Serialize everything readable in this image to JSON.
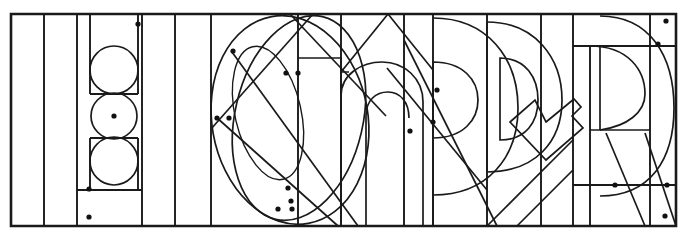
{
  "artwork": {
    "title": "Geometric lettering construction drawing",
    "medium": "line drawing",
    "stroke_color": "#1a1a1a",
    "background_color": "#ffffff",
    "width": 688,
    "height": 241,
    "letterforms_depicted": "H I O n P D R",
    "description": "Overlapping constructed letterforms inside a rectangular frame with vertical guide columns, stacked circles, ellipses, diagonals and construction dots"
  },
  "frame": {
    "name": "outer-rectangle",
    "x": 11,
    "y": 14,
    "width": 665,
    "height": 212
  },
  "guide_columns": {
    "label": "vertical-guide-lines",
    "x_positions": [
      44,
      77,
      110,
      142,
      175,
      211,
      252,
      298,
      341,
      388,
      433,
      487,
      541,
      573,
      614,
      650
    ]
  },
  "guide_rows": {
    "label": "horizontal-guide-lines",
    "y_positions": [
      31,
      57,
      90,
      124,
      158,
      190
    ]
  },
  "circles": {
    "label": "stacked-construction-circles",
    "items": [
      {
        "name": "circle-top",
        "cx": 114,
        "cy": 70,
        "r": 24
      },
      {
        "name": "circle-middle",
        "cx": 114,
        "cy": 116,
        "r": 23
      },
      {
        "name": "circle-bottom",
        "cx": 114,
        "cy": 161,
        "r": 24
      }
    ]
  },
  "ellipses": {
    "label": "letter-o-construction-ellipses",
    "items": [
      {
        "name": "ellipse-o-outer",
        "cx": 288,
        "cy": 120,
        "rx": 78,
        "ry": 105,
        "rotation": -12
      },
      {
        "name": "ellipse-o-inner",
        "cx": 272,
        "cy": 112,
        "rx": 34,
        "ry": 68,
        "rotation": -14
      },
      {
        "name": "ellipse-o-tilt",
        "cx": 296,
        "cy": 118,
        "rx": 62,
        "ry": 100,
        "rotation": 14
      }
    ]
  },
  "construction_dots": {
    "label": "construction-reference-points",
    "radius": 2.6,
    "points": [
      {
        "x": 138,
        "y": 24
      },
      {
        "x": 114,
        "y": 116
      },
      {
        "x": 89,
        "y": 189
      },
      {
        "x": 89,
        "y": 217
      },
      {
        "x": 233,
        "y": 51
      },
      {
        "x": 217,
        "y": 118
      },
      {
        "x": 229,
        "y": 118
      },
      {
        "x": 286,
        "y": 73
      },
      {
        "x": 298,
        "y": 73
      },
      {
        "x": 288,
        "y": 188
      },
      {
        "x": 291,
        "y": 201
      },
      {
        "x": 278,
        "y": 209
      },
      {
        "x": 292,
        "y": 209
      },
      {
        "x": 410,
        "y": 131
      },
      {
        "x": 433,
        "y": 122
      },
      {
        "x": 437,
        "y": 90
      },
      {
        "x": 615,
        "y": 185
      },
      {
        "x": 666,
        "y": 21
      },
      {
        "x": 658,
        "y": 44
      },
      {
        "x": 667,
        "y": 185
      },
      {
        "x": 665,
        "y": 216
      }
    ]
  },
  "letters": {
    "letter_n": {
      "name": "letter-n",
      "stem_x": 298,
      "top_y": 60,
      "bottom_y": 225
    },
    "letter_p_left": {
      "name": "letter-p-first",
      "bowl_cx": 434,
      "bowl_cy": 100
    },
    "letter_d": {
      "name": "letter-d",
      "bowl_cx": 505,
      "bowl_cy": 100
    },
    "letter_r": {
      "name": "letter-r",
      "bowl_cx": 617,
      "bowl_cy": 108
    }
  }
}
